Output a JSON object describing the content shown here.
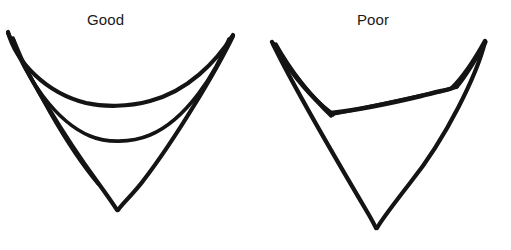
{
  "figure": {
    "background_color": "#ffffff",
    "ink_color": "#141414",
    "width": 511,
    "height": 250,
    "type": "line-drawing-comparison",
    "panels": [
      {
        "id": "good",
        "label": "Good",
        "label_x": 87,
        "label_y": 11,
        "description": "Hand-drawn V-shaped chevron outline with a smooth deep curved upper boundary and a pointed lower vertex; inner and outer contours are evenly spaced and symmetric.",
        "left_tip": [
          8,
          32
        ],
        "right_tip": [
          233,
          35
        ],
        "bottom_vertex": [
          117,
          211
        ],
        "outer_curve_low_point": [
          120,
          104
        ],
        "inner_curve_low_point": [
          118,
          141
        ]
      },
      {
        "id": "poor",
        "label": "Poor",
        "label_x": 357,
        "label_y": 11,
        "description": "Hand-drawn V-shaped chevron outline that is asymmetric and kinked; the inner contour meets the outer contour with a sharp crease on the left and the lower vertex is shifted right.",
        "left_tip": [
          272,
          42
        ],
        "right_tip": [
          485,
          41
        ],
        "bottom_vertex": [
          376,
          228
        ],
        "kink_point": [
          330,
          113
        ],
        "right_junction": [
          452,
          88
        ]
      }
    ]
  },
  "strokes": {
    "good": {
      "outer_upper_curve": "M 8,32 C 16,62 46,93 86,103 C 104,107 128,107 150,101 C 188,91 216,62 233,35",
      "outer_left_limb": "M 8,33 C 26,74 66,139 96,180 C 104,191 112,202 117,210",
      "outer_right_limb": "M 233,36 C 216,71 176,138 143,181 C 134,193 123,203 118,210",
      "inner_curve": "M 13,38 C 24,76 56,122 90,136 C 106,143 131,143 150,135 C 186,120 216,73 229,39",
      "lower_inner_hint": "M 14,40 C 30,80 66,146 98,184"
    },
    "poor": {
      "outer_upper_left": "M 272,42 C 281,58 298,82 316,100 C 321,105 327,110 331,113",
      "outer_upper_right": "M 331,113 C 356,110 392,103 421,96 C 440,91 452,89 452,88",
      "outer_right_rise": "M 452,88 C 462,78 474,61 485,41",
      "inner_left_a": "M 273,43 C 285,63 306,90 325,108 C 329,112 332,114 333,115",
      "inner_left_b": "M 276,44 C 290,69 312,98 331,116",
      "inner_upper_long": "M 333,114 C 365,108 410,98 442,91 C 450,89 455,88 457,87",
      "inner_right_loop": "M 457,87 C 468,74 478,56 486,42",
      "left_limb_long": "M 273,44 C 294,88 340,166 369,215 C 373,222 375,226 376,228",
      "right_limb_long": "M 485,42 C 477,74 447,137 410,183 C 396,201 382,219 377,228"
    }
  },
  "style": {
    "stroke_width_outer": 4.2,
    "stroke_width_inner": 3.4,
    "label_font_size": "15px",
    "label_color": "#1a1a1a"
  }
}
